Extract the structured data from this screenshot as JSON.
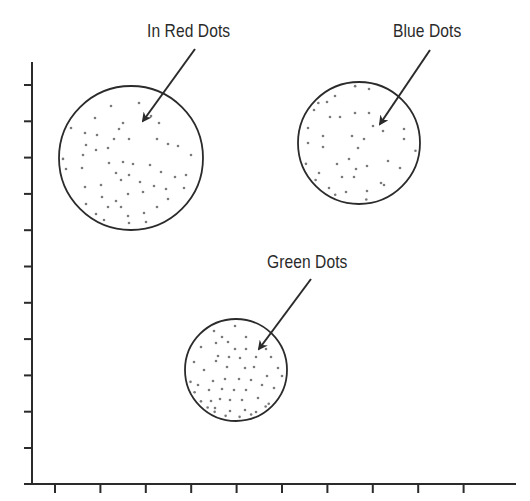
{
  "diagram": {
    "type": "scatter-clusters",
    "axes": {
      "x_ticks": 10,
      "y_ticks": 11,
      "tick_labels": []
    },
    "colors": {
      "stroke": "#2b2b2b",
      "dot": "#7a7a7a",
      "background": "#ffffff"
    },
    "clusters": [
      {
        "id": "red",
        "label": "In Red Dots",
        "dot_color_name": "red",
        "dots": [
          [
            -20,
            -52
          ],
          [
            8,
            -55
          ],
          [
            -36,
            -40
          ],
          [
            -8,
            -35
          ],
          [
            20,
            -42
          ],
          [
            28,
            -35
          ],
          [
            -60,
            -30
          ],
          [
            -12,
            -29
          ],
          [
            -46,
            -25
          ],
          [
            -34,
            -23
          ],
          [
            -45,
            -13
          ],
          [
            -35,
            -8
          ],
          [
            -17,
            -19
          ],
          [
            -2,
            -19
          ],
          [
            26,
            -19
          ],
          [
            47,
            -12
          ],
          [
            -48,
            -3
          ],
          [
            -23,
            -10
          ],
          [
            37,
            -14
          ],
          [
            -65,
            11
          ],
          [
            -49,
            10
          ],
          [
            -8,
            4
          ],
          [
            -22,
            5
          ],
          [
            2,
            6
          ],
          [
            19,
            7
          ],
          [
            60,
            -3
          ],
          [
            -75,
            1
          ],
          [
            -15,
            15
          ],
          [
            -2,
            17
          ],
          [
            30,
            14
          ],
          [
            44,
            19
          ],
          [
            55,
            17
          ],
          [
            -46,
            29
          ],
          [
            -30,
            27
          ],
          [
            -10,
            22
          ],
          [
            9,
            24
          ],
          [
            23,
            28
          ],
          [
            -15,
            43
          ],
          [
            -45,
            46
          ],
          [
            -29,
            39
          ],
          [
            -3,
            36
          ],
          [
            12,
            34
          ],
          [
            35,
            31
          ],
          [
            53,
            30
          ],
          [
            -23,
            49
          ],
          [
            -10,
            49
          ],
          [
            -35,
            56
          ],
          [
            -3,
            58
          ],
          [
            13,
            55
          ],
          [
            26,
            49
          ],
          [
            37,
            41
          ],
          [
            -27,
            62
          ],
          [
            -2,
            65
          ],
          [
            15,
            64
          ]
        ]
      },
      {
        "id": "blue",
        "label": "Blue Dots",
        "dot_color_name": "blue",
        "dots": [
          [
            -4,
            -59
          ],
          [
            -24,
            -47
          ],
          [
            10,
            -54
          ],
          [
            -32,
            -41
          ],
          [
            -29,
            -26
          ],
          [
            -19,
            -26
          ],
          [
            -4,
            -30
          ],
          [
            10,
            -30
          ],
          [
            -45,
            -33
          ],
          [
            -51,
            -15
          ],
          [
            -36,
            -7
          ],
          [
            -7,
            -7
          ],
          [
            14,
            -17
          ],
          [
            24,
            -12
          ],
          [
            45,
            -4
          ],
          [
            -51,
            0
          ],
          [
            -36,
            4
          ],
          [
            -1,
            5
          ],
          [
            5,
            -4
          ],
          [
            29,
            18
          ],
          [
            -56,
            22
          ],
          [
            -10,
            16
          ],
          [
            -22,
            21
          ],
          [
            -3,
            26
          ],
          [
            8,
            23
          ],
          [
            41,
            25
          ],
          [
            58,
            8
          ],
          [
            45,
            -14
          ],
          [
            -40,
            30
          ],
          [
            -17,
            34
          ],
          [
            -5,
            34
          ],
          [
            22,
            40
          ],
          [
            -54,
            46
          ],
          [
            -30,
            45
          ],
          [
            -13,
            49
          ],
          [
            8,
            48
          ],
          [
            25,
            42
          ],
          [
            -28,
            61
          ],
          [
            8,
            62
          ],
          [
            -55,
            -54
          ]
        ]
      },
      {
        "id": "green",
        "label": "Green Dots",
        "dot_color_name": "green",
        "dots": [
          [
            -1,
            -44
          ],
          [
            -22,
            -39
          ],
          [
            -14,
            -33
          ],
          [
            10,
            -33
          ],
          [
            -8,
            -28
          ],
          [
            -20,
            -27
          ],
          [
            -35,
            -23
          ],
          [
            -1,
            -21
          ],
          [
            10,
            -21
          ],
          [
            30,
            -21
          ],
          [
            -42,
            -8
          ],
          [
            -18,
            -14
          ],
          [
            -7,
            -13
          ],
          [
            4,
            -12
          ],
          [
            20,
            -13
          ],
          [
            35,
            -13
          ],
          [
            -32,
            0
          ],
          [
            -9,
            -3
          ],
          [
            -20,
            -9
          ],
          [
            9,
            -2
          ],
          [
            18,
            -3
          ],
          [
            42,
            -2
          ],
          [
            -50,
            13
          ],
          [
            -23,
            11
          ],
          [
            -11,
            9
          ],
          [
            3,
            9
          ],
          [
            15,
            10
          ],
          [
            31,
            6
          ],
          [
            46,
            6
          ],
          [
            -38,
            15
          ],
          [
            -27,
            20
          ],
          [
            -14,
            19
          ],
          [
            -2,
            20
          ],
          [
            10,
            20
          ],
          [
            26,
            15
          ],
          [
            38,
            18
          ],
          [
            -52,
            28
          ],
          [
            -38,
            34
          ],
          [
            -25,
            31
          ],
          [
            -16,
            29
          ],
          [
            -6,
            30
          ],
          [
            6,
            30
          ],
          [
            22,
            28
          ],
          [
            33,
            34
          ],
          [
            -34,
            45
          ],
          [
            -21,
            38
          ],
          [
            -6,
            41
          ],
          [
            9,
            40
          ],
          [
            20,
            42
          ],
          [
            35,
            43
          ],
          [
            -26,
            51
          ],
          [
            -12,
            53
          ],
          [
            4,
            52
          ],
          [
            16,
            47
          ]
        ]
      }
    ]
  }
}
